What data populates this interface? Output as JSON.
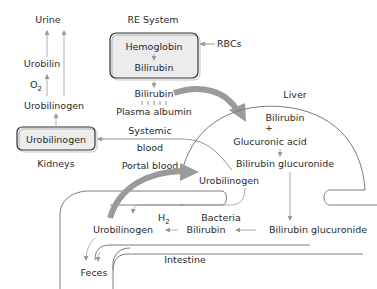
{
  "diagram": {
    "re_system": {
      "title": "RE System",
      "box_top": "Hemoglobin",
      "box_bottom": "Bilirubin",
      "input": "RBCs"
    },
    "plasma": {
      "bilirubin": "Bilirubin",
      "albumin": "Plasma albumin"
    },
    "kidney": {
      "urine": "Urine",
      "urobilin": "Urobilin",
      "o2": "O",
      "o2_sub": "2",
      "urobilinogen": "Urobilinogen",
      "box": "Urobilinogen",
      "label": "Kidneys"
    },
    "blood": {
      "systemic_1": "Systemic",
      "systemic_2": "blood",
      "portal": "Portal blood"
    },
    "liver": {
      "label": "Liver",
      "bilirubin": "Bilirubin",
      "plus": "+",
      "glucuronic": "Glucuronic acid",
      "glucuronide": "Bilirubin glucuronide"
    },
    "intestine": {
      "urobilinogen_upper": "Urobilinogen",
      "h2": "H",
      "h2_sub": "2",
      "bacteria": "Bacteria",
      "urobilinogen": "Urobilinogen",
      "bilirubin": "Bilirubin",
      "glucuronide": "Bilirubin glucuronide",
      "label": "Intestine",
      "feces": "Feces"
    },
    "colors": {
      "box_fill": "#ececec",
      "big_arrow": "#9a9a9a",
      "line": "#8a8a8a",
      "text": "#2a2a2a"
    }
  }
}
